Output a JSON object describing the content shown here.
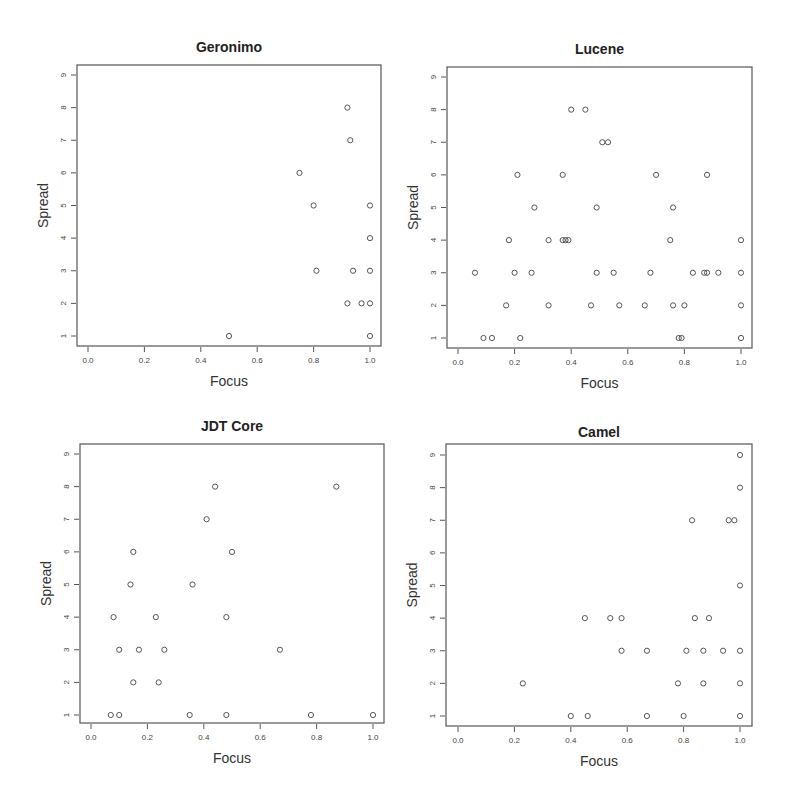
{
  "chart_data": [
    {
      "type": "scatter",
      "title": "Geronimo",
      "xlabel": "Focus",
      "ylabel": "Spread",
      "xlim": [
        0.0,
        1.0
      ],
      "ylim": [
        1,
        9
      ],
      "xticks": [
        "0.0",
        "0.2",
        "0.4",
        "0.6",
        "0.8",
        "1.0"
      ],
      "yticks": [
        "1",
        "2",
        "3",
        "4",
        "5",
        "6",
        "7",
        "8",
        "9"
      ],
      "grid": false,
      "points": [
        [
          0.5,
          1
        ],
        [
          1.0,
          1
        ],
        [
          0.92,
          2
        ],
        [
          0.97,
          2
        ],
        [
          1.0,
          2
        ],
        [
          0.81,
          3
        ],
        [
          0.94,
          3
        ],
        [
          1.0,
          3
        ],
        [
          1.0,
          4
        ],
        [
          0.8,
          5
        ],
        [
          1.0,
          5
        ],
        [
          0.75,
          6
        ],
        [
          0.93,
          7
        ],
        [
          0.92,
          8
        ]
      ]
    },
    {
      "type": "scatter",
      "title": "Lucene",
      "xlabel": "Focus",
      "ylabel": "Spread",
      "xlim": [
        0.0,
        1.0
      ],
      "ylim": [
        1,
        9
      ],
      "xticks": [
        "0.0",
        "0.2",
        "0.4",
        "0.6",
        "0.8",
        "1.0"
      ],
      "yticks": [
        "1",
        "2",
        "3",
        "4",
        "5",
        "6",
        "7",
        "8",
        "9"
      ],
      "grid": false,
      "points": [
        [
          0.09,
          1
        ],
        [
          0.12,
          1
        ],
        [
          0.22,
          1
        ],
        [
          0.78,
          1
        ],
        [
          0.79,
          1
        ],
        [
          1.0,
          1
        ],
        [
          0.17,
          2
        ],
        [
          0.32,
          2
        ],
        [
          0.47,
          2
        ],
        [
          0.57,
          2
        ],
        [
          0.66,
          2
        ],
        [
          0.76,
          2
        ],
        [
          0.8,
          2
        ],
        [
          1.0,
          2
        ],
        [
          0.06,
          3
        ],
        [
          0.2,
          3
        ],
        [
          0.26,
          3
        ],
        [
          0.49,
          3
        ],
        [
          0.55,
          3
        ],
        [
          0.68,
          3
        ],
        [
          0.83,
          3
        ],
        [
          0.87,
          3
        ],
        [
          0.88,
          3
        ],
        [
          0.92,
          3
        ],
        [
          1.0,
          3
        ],
        [
          0.18,
          4
        ],
        [
          0.32,
          4
        ],
        [
          0.37,
          4
        ],
        [
          0.38,
          4
        ],
        [
          0.39,
          4
        ],
        [
          0.75,
          4
        ],
        [
          1.0,
          4
        ],
        [
          0.27,
          5
        ],
        [
          0.49,
          5
        ],
        [
          0.76,
          5
        ],
        [
          0.21,
          6
        ],
        [
          0.37,
          6
        ],
        [
          0.7,
          6
        ],
        [
          0.88,
          6
        ],
        [
          0.51,
          7
        ],
        [
          0.53,
          7
        ],
        [
          0.4,
          8
        ],
        [
          0.45,
          8
        ]
      ]
    },
    {
      "type": "scatter",
      "title": "JDT Core",
      "xlabel": "Focus",
      "ylabel": "Spread",
      "xlim": [
        0.0,
        1.0
      ],
      "ylim": [
        1,
        9
      ],
      "xticks": [
        "0.0",
        "0.2",
        "0.4",
        "0.6",
        "0.8",
        "1.0"
      ],
      "yticks": [
        "1",
        "2",
        "3",
        "4",
        "5",
        "6",
        "7",
        "8",
        "9"
      ],
      "grid": false,
      "points": [
        [
          0.07,
          1
        ],
        [
          0.1,
          1
        ],
        [
          0.35,
          1
        ],
        [
          0.48,
          1
        ],
        [
          0.78,
          1
        ],
        [
          1.0,
          1
        ],
        [
          0.15,
          2
        ],
        [
          0.24,
          2
        ],
        [
          0.1,
          3
        ],
        [
          0.17,
          3
        ],
        [
          0.26,
          3
        ],
        [
          0.67,
          3
        ],
        [
          0.08,
          4
        ],
        [
          0.23,
          4
        ],
        [
          0.48,
          4
        ],
        [
          0.14,
          5
        ],
        [
          0.36,
          5
        ],
        [
          0.15,
          6
        ],
        [
          0.5,
          6
        ],
        [
          0.41,
          7
        ],
        [
          0.44,
          8
        ],
        [
          0.87,
          8
        ]
      ]
    },
    {
      "type": "scatter",
      "title": "Camel",
      "xlabel": "Focus",
      "ylabel": "Spread",
      "xlim": [
        0.0,
        1.0
      ],
      "ylim": [
        1,
        9
      ],
      "xticks": [
        "0.0",
        "0.2",
        "0.4",
        "0.6",
        "0.8",
        "1.0"
      ],
      "yticks": [
        "1",
        "2",
        "3",
        "4",
        "5",
        "6",
        "7",
        "8",
        "9"
      ],
      "grid": false,
      "points": [
        [
          0.4,
          1
        ],
        [
          0.46,
          1
        ],
        [
          0.67,
          1
        ],
        [
          0.8,
          1
        ],
        [
          1.0,
          1
        ],
        [
          0.23,
          2
        ],
        [
          0.78,
          2
        ],
        [
          0.87,
          2
        ],
        [
          1.0,
          2
        ],
        [
          0.58,
          3
        ],
        [
          0.67,
          3
        ],
        [
          0.81,
          3
        ],
        [
          0.87,
          3
        ],
        [
          0.94,
          3
        ],
        [
          1.0,
          3
        ],
        [
          0.45,
          4
        ],
        [
          0.54,
          4
        ],
        [
          0.58,
          4
        ],
        [
          0.84,
          4
        ],
        [
          0.89,
          4
        ],
        [
          1.0,
          5
        ],
        [
          0.83,
          7
        ],
        [
          0.96,
          7
        ],
        [
          0.98,
          7
        ],
        [
          1.0,
          8
        ],
        [
          1.0,
          9
        ]
      ]
    }
  ]
}
